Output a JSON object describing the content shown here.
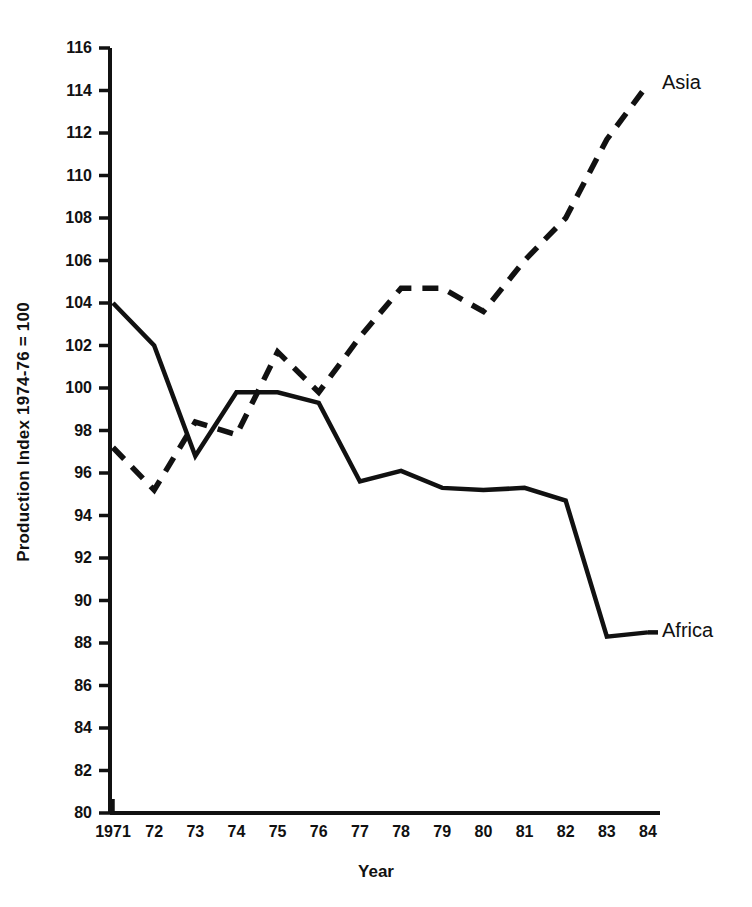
{
  "chart_data": {
    "type": "line",
    "title": "",
    "xlabel": "Year",
    "ylabel": "Production Index 1974-76 = 100",
    "x": [
      1971,
      1972,
      1973,
      1974,
      1975,
      1976,
      1977,
      1978,
      1979,
      1980,
      1981,
      1982,
      1983,
      1984
    ],
    "categories": [
      "1971",
      "72",
      "73",
      "74",
      "75",
      "76",
      "77",
      "78",
      "79",
      "80",
      "81",
      "82",
      "83",
      "84"
    ],
    "xlim": [
      1971,
      1984
    ],
    "ylim": [
      80,
      116
    ],
    "ytick_values": [
      80,
      82,
      84,
      86,
      88,
      90,
      92,
      94,
      96,
      98,
      100,
      102,
      104,
      106,
      108,
      110,
      112,
      114,
      116
    ],
    "ytick_labels": [
      "80",
      "82",
      "84",
      "86",
      "88",
      "90",
      "92",
      "94",
      "96",
      "98",
      "100",
      "102",
      "104",
      "106",
      "108",
      "110",
      "112",
      "114",
      "116"
    ],
    "grid": false,
    "legend_position": "inline-end-of-line",
    "series": [
      {
        "name": "Africa",
        "style": "solid",
        "color": "#111111",
        "label_text": "Africa",
        "values": [
          104.0,
          102.0,
          96.8,
          99.8,
          99.8,
          99.3,
          95.6,
          96.1,
          95.3,
          95.2,
          95.3,
          94.7,
          88.3,
          88.5
        ]
      },
      {
        "name": "Asia",
        "style": "dashed",
        "color": "#111111",
        "label_text": "Asia",
        "values": [
          97.2,
          95.2,
          98.4,
          97.8,
          101.7,
          99.8,
          102.4,
          104.7,
          104.7,
          103.6,
          106.0,
          108.0,
          111.7,
          114.3
        ]
      }
    ]
  }
}
